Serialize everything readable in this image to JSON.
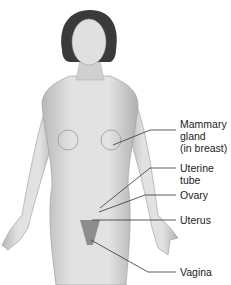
{
  "figure": {
    "labels": [
      {
        "id": "mammary",
        "lines": [
          "Mammary",
          "gland",
          "(in breast)"
        ]
      },
      {
        "id": "uterine-tube",
        "lines": [
          "Uterine",
          "tube"
        ]
      },
      {
        "id": "ovary",
        "lines": [
          "Ovary"
        ]
      },
      {
        "id": "uterus",
        "lines": [
          "Uterus"
        ]
      },
      {
        "id": "vagina",
        "lines": [
          "Vagina"
        ]
      }
    ]
  },
  "colors": {
    "background": "#ffffff",
    "body": "#d8d8d8",
    "shadow": "#a9a9a9",
    "hair": "#3a3a3a",
    "leader": "#333333",
    "text": "#222222"
  }
}
